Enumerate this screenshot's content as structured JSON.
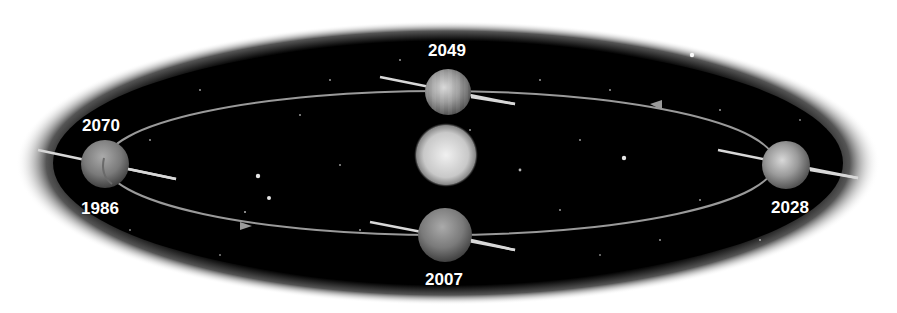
{
  "diagram": {
    "colors": {
      "space": "#000000",
      "halo": "#ffffff",
      "orbit_line": "#9a9a9a",
      "axis_line": "#d8d8d8",
      "label": "#ffffff"
    },
    "sun": {
      "name": "sun"
    },
    "positions": [
      {
        "id": "top",
        "year": "2049"
      },
      {
        "id": "left-upper",
        "year": "2070"
      },
      {
        "id": "left-lower",
        "year": "1986"
      },
      {
        "id": "bottom",
        "year": "2007"
      },
      {
        "id": "right",
        "year": "2028"
      }
    ],
    "direction_arrows": 2
  }
}
